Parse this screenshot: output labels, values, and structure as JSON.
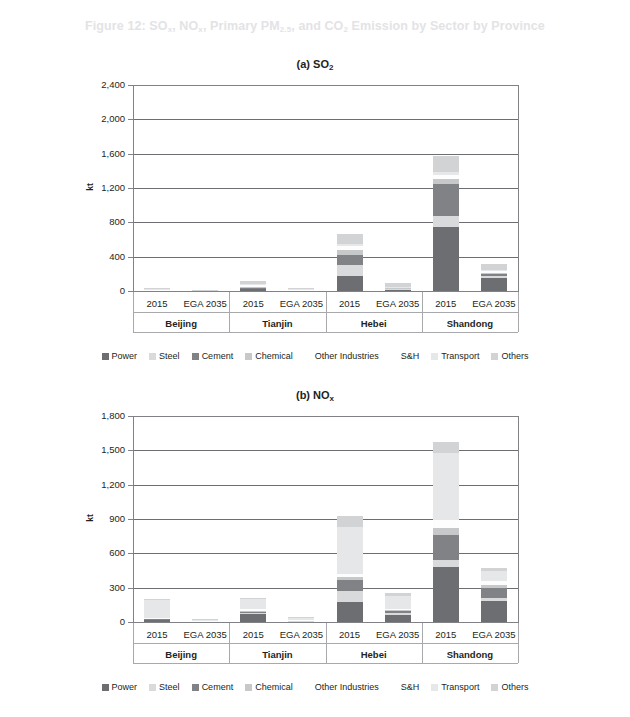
{
  "figure": {
    "title_parts": [
      "Figure 12: SO",
      "x",
      ", NO",
      "x",
      ", Primary PM",
      "2.5",
      ", and CO",
      "2",
      " Emission by Sector by Province"
    ],
    "title_plain": "Figure 12: SO2, NOx, Primary PM2.5, and CO2 Emission by Sector by Province"
  },
  "legend": {
    "items": [
      {
        "label": "Power",
        "color": "#6d6e71"
      },
      {
        "label": "Steel",
        "color": "#d9dadb"
      },
      {
        "label": "Cement",
        "color": "#808285"
      },
      {
        "label": "Chemical",
        "color": "#c7c8ca"
      },
      {
        "label": "Other Industries",
        "color": "#ffffff"
      },
      {
        "label": "S&H",
        "color": "#ffffff"
      },
      {
        "label": "Transport",
        "color": "#e6e7e8"
      },
      {
        "label": "Others",
        "color": "#d1d3d4"
      }
    ]
  },
  "panels": [
    {
      "key": "a",
      "title_prefix": "(a) SO",
      "title_sub": "2",
      "ylabel": "kt"
    },
    {
      "key": "b",
      "title_prefix": "(b) NO",
      "title_sub": "x",
      "ylabel": "kt"
    }
  ],
  "chart_data": [
    {
      "type": "bar",
      "subtype": "stacked",
      "title": "(a) SO2",
      "xlabel": "",
      "ylabel": "kt",
      "ylim": [
        0,
        2400
      ],
      "yticks": [
        0,
        400,
        800,
        1200,
        1600,
        2000,
        2400
      ],
      "ytick_labels": [
        "0",
        "400",
        "800",
        "1,200",
        "1,600",
        "2,000",
        "2,400"
      ],
      "grid": true,
      "legend_position": "bottom",
      "provinces": [
        "Beijing",
        "Tianjin",
        "Hebei",
        "Shandong"
      ],
      "scenarios": [
        "2015",
        "EGA 2035"
      ],
      "categories": [
        "Beijing 2015",
        "Beijing EGA 2035",
        "Tianjin 2015",
        "Tianjin EGA 2035",
        "Hebei 2015",
        "Hebei EGA 2035",
        "Shandong 2015",
        "Shandong EGA 2035"
      ],
      "series": [
        {
          "name": "Power",
          "color": "#6d6e71",
          "values": [
            8,
            3,
            28,
            6,
            180,
            18,
            750,
            150
          ]
        },
        {
          "name": "Steel",
          "color": "#d9dadb",
          "values": [
            2,
            1,
            6,
            2,
            120,
            8,
            120,
            20
          ]
        },
        {
          "name": "Cement",
          "color": "#808285",
          "values": [
            2,
            1,
            6,
            2,
            120,
            6,
            380,
            30
          ]
        },
        {
          "name": "Chemical",
          "color": "#c7c8ca",
          "values": [
            3,
            1,
            12,
            3,
            60,
            6,
            50,
            15
          ]
        },
        {
          "name": "Other Industries",
          "color": "#ffffff",
          "values": [
            2,
            1,
            8,
            2,
            20,
            4,
            30,
            10
          ]
        },
        {
          "name": "S&H",
          "color": "#ffffff",
          "values": [
            2,
            1,
            6,
            2,
            20,
            4,
            20,
            10
          ]
        },
        {
          "name": "Transport",
          "color": "#e6e7e8",
          "values": [
            4,
            2,
            14,
            4,
            30,
            6,
            40,
            15
          ]
        },
        {
          "name": "Others",
          "color": "#d1d3d4",
          "values": [
            10,
            4,
            40,
            10,
            110,
            40,
            180,
            70
          ]
        }
      ]
    },
    {
      "type": "bar",
      "subtype": "stacked",
      "title": "(b) NOx",
      "xlabel": "",
      "ylabel": "kt",
      "ylim": [
        0,
        1800
      ],
      "yticks": [
        0,
        300,
        600,
        900,
        1200,
        1500,
        1800
      ],
      "ytick_labels": [
        "0",
        "300",
        "600",
        "900",
        "1,200",
        "1,500",
        "1,800"
      ],
      "grid": true,
      "legend_position": "bottom",
      "provinces": [
        "Beijing",
        "Tianjin",
        "Hebei",
        "Shandong"
      ],
      "scenarios": [
        "2015",
        "EGA 2035"
      ],
      "categories": [
        "Beijing 2015",
        "Beijing EGA 2035",
        "Tianjin 2015",
        "Tianjin EGA 2035",
        "Hebei 2015",
        "Hebei EGA 2035",
        "Shandong 2015",
        "Shandong EGA 2035"
      ],
      "series": [
        {
          "name": "Power",
          "color": "#6d6e71",
          "values": [
            22,
            8,
            70,
            10,
            175,
            60,
            480,
            180
          ]
        },
        {
          "name": "Steel",
          "color": "#d9dadb",
          "values": [
            4,
            1,
            10,
            2,
            95,
            18,
            60,
            30
          ]
        },
        {
          "name": "Cement",
          "color": "#808285",
          "values": [
            4,
            1,
            10,
            2,
            95,
            18,
            220,
            90
          ]
        },
        {
          "name": "Chemical",
          "color": "#c7c8ca",
          "values": [
            3,
            1,
            8,
            2,
            25,
            8,
            60,
            25
          ]
        },
        {
          "name": "Other Industries",
          "color": "#ffffff",
          "values": [
            3,
            1,
            8,
            2,
            15,
            6,
            40,
            15
          ]
        },
        {
          "name": "S&H",
          "color": "#ffffff",
          "values": [
            3,
            1,
            8,
            2,
            15,
            6,
            30,
            15
          ]
        },
        {
          "name": "Transport",
          "color": "#e6e7e8",
          "values": [
            150,
            6,
            85,
            22,
            410,
            110,
            590,
            90
          ]
        },
        {
          "name": "Others",
          "color": "#d1d3d4",
          "values": [
            8,
            3,
            12,
            6,
            100,
            30,
            90,
            25
          ]
        }
      ]
    }
  ]
}
